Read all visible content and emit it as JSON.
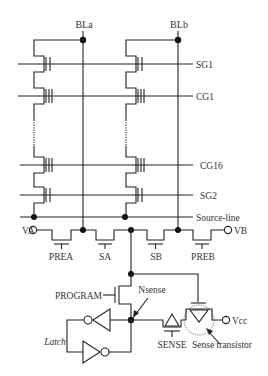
{
  "diagram": {
    "bitlines": [
      "BLa",
      "BLb"
    ],
    "word_lines": [
      "SG1",
      "CG1",
      "CG16",
      "SG2",
      "Source-line"
    ],
    "voltage_nodes": {
      "left": "VA",
      "right": "VB",
      "supply": "Vcc"
    },
    "bottom_gates": [
      "PREA",
      "SA",
      "SB",
      "PREB"
    ],
    "program_label": "PROGRAM",
    "nsense_label": "Nsense",
    "latch_label": "Latch",
    "sense_label": "SENSE",
    "sense_transistor_label": "Sense transistor"
  }
}
